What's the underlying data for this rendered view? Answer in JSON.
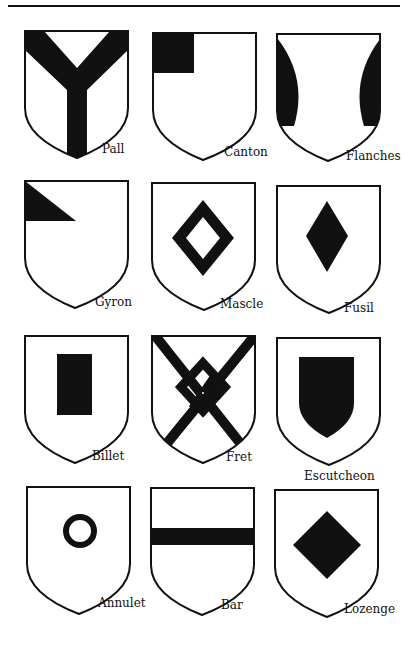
{
  "page": {
    "header_rule": true
  },
  "plate": {
    "charges": [
      {
        "name": "Pall",
        "row": 1,
        "col": 1
      },
      {
        "name": "Canton",
        "row": 1,
        "col": 2
      },
      {
        "name": "Flanches",
        "row": 1,
        "col": 3
      },
      {
        "name": "Gyron",
        "row": 2,
        "col": 1
      },
      {
        "name": "Mascle",
        "row": 2,
        "col": 2
      },
      {
        "name": "Fusil",
        "row": 2,
        "col": 3
      },
      {
        "name": "Billet",
        "row": 3,
        "col": 1
      },
      {
        "name": "Fret",
        "row": 3,
        "col": 2
      },
      {
        "name": "Escutcheon",
        "row": 3,
        "col": 3
      },
      {
        "name": "Annulet",
        "row": 4,
        "col": 1
      },
      {
        "name": "Bar",
        "row": 4,
        "col": 2
      },
      {
        "name": "Lozenge",
        "row": 4,
        "col": 3
      }
    ]
  },
  "colors": {
    "ink": "#111111",
    "paper": "#ffffff"
  }
}
